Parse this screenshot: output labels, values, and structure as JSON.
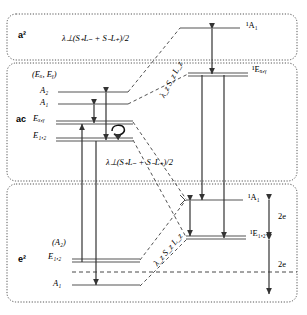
{
  "figure": {
    "type": "energy-level-diagram",
    "background": "#ffffff",
    "line_color": "#444444",
    "arrow_color": "#333333",
    "panel_border_style": "dotted rounded"
  },
  "panels": [
    {
      "id": "a2",
      "tag": "a²"
    },
    {
      "id": "ac",
      "tag": "ac"
    },
    {
      "id": "e2",
      "tag": "e²"
    }
  ],
  "left_levels": {
    "group_label_top": "(Eₓ, Eᵧ)",
    "group_label_bottom": "(A₂)",
    "items": [
      {
        "name": "A2",
        "label": "A₂",
        "degenerate": false
      },
      {
        "name": "A1",
        "label": "A₁",
        "degenerate": false
      },
      {
        "name": "Exy",
        "label": "Eₓ,ᵧ",
        "degenerate": true
      },
      {
        "name": "E12",
        "label": "E₁,₂",
        "degenerate": true
      },
      {
        "name": "E12b",
        "label": "E₁,₂",
        "degenerate": true
      },
      {
        "name": "A1b",
        "label": "A₁",
        "degenerate": false
      }
    ]
  },
  "right_levels": [
    {
      "name": "1A1-top",
      "label": "¹A₁",
      "degenerate": false
    },
    {
      "name": "1Exy",
      "label": "¹Eₓ,ᵧ",
      "degenerate": true
    },
    {
      "name": "1A1-bot",
      "label": "¹A₁",
      "degenerate": false
    },
    {
      "name": "1E12",
      "label": "¹E₁,₂",
      "degenerate": true
    }
  ],
  "operators": [
    {
      "name": "lambda-perp-top",
      "text": "λ⊥(S₊L₋ + S₋L₊)/2",
      "rotated": false
    },
    {
      "name": "lambda-perp-middle",
      "text": "λ⊥(S₊L₋ + S₋L₊)/2",
      "rotated": false
    },
    {
      "name": "lambda-z-upper",
      "text": "λ_z S_z L_z",
      "rotated": true
    },
    {
      "name": "lambda-z-lower",
      "text": "λ_z S_z L_z",
      "rotated": true
    }
  ],
  "gap_labels": [
    {
      "name": "gap-upper",
      "text": "2e"
    },
    {
      "name": "gap-lower",
      "text": "2e"
    }
  ],
  "annotations": [
    {
      "name": "spin-orbit-loop",
      "text": "circular-arrow"
    }
  ]
}
